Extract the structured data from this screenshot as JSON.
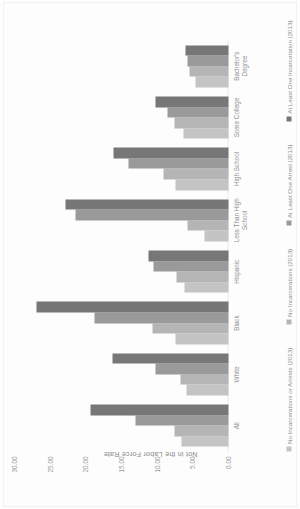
{
  "chart_data": {
    "type": "bar",
    "title": "",
    "xlabel": "",
    "ylabel": "Not in the Labor Force Rate",
    "ylim": [
      0,
      30
    ],
    "yticks": [
      "0.00",
      "5.00",
      "10.00",
      "15.00",
      "20.00",
      "25.00",
      "30.00"
    ],
    "grid": false,
    "legend_position": "bottom",
    "orientation": "rotated-90",
    "categories": [
      "All",
      "White",
      "Black",
      "Hispanic",
      "Less Than High School",
      "High School",
      "Some College",
      "Bachelor's Degree"
    ],
    "series": [
      {
        "name": "No Incarcerations or Arrests (2013)",
        "color": "#c4c4c4",
        "values": [
          6.6,
          5.9,
          7.5,
          6.2,
          3.3,
          7.4,
          6.3,
          4.6
        ]
      },
      {
        "name": "No Incarcerations (2013)",
        "color": "#b5b5b5",
        "values": [
          7.6,
          6.8,
          10.6,
          7.3,
          5.7,
          9.1,
          7.6,
          5.4
        ]
      },
      {
        "name": "At Least One Arrest (2013)",
        "color": "#9a9a9a",
        "values": [
          13.0,
          10.3,
          18.8,
          10.5,
          21.5,
          14.0,
          8.6,
          5.7
        ]
      },
      {
        "name": "At Least One Incarceration (2013)",
        "color": "#777777",
        "values": [
          19.4,
          16.2,
          26.9,
          11.2,
          22.9,
          16.1,
          10.2,
          6.1
        ]
      }
    ]
  },
  "axis": {
    "y_title": "Not in the Labor Force Rate"
  },
  "legend": {
    "items": [
      "No Incarcerations or Arrests (2013)",
      "No Incarcerations (2013)",
      "At Least One Arrest (2013)",
      "At Least One Incarceration (2013)"
    ]
  }
}
